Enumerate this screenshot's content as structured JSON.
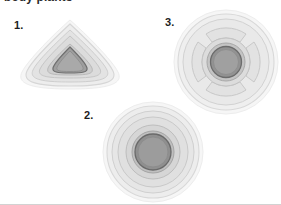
{
  "figure": {
    "heading_clipped": "body plants",
    "background_color": "#ffffff",
    "width": 281,
    "height": 205,
    "bottom_rule_color": "#d2d2d2"
  },
  "palette": {
    "halo": "#f4f4f4",
    "ring_outer": "#ededed",
    "ring_outer_stroke": "#d8d8d8",
    "ring_mid": "#e3e3e3",
    "ring_mid_stroke": "#cfcfcf",
    "ring_inner": "#d6d6d6",
    "ring_inner_stroke": "#bdbdbd",
    "core_fill": "#9a9a9a",
    "core_stroke": "#6f6f6f",
    "core_highlight": "#a8a8a8",
    "lobe_fill": "#e9e9e9",
    "lobe_stroke": "#cccccc",
    "label_color": "#1d1d1d"
  },
  "panels": [
    {
      "id": "panel-1",
      "label": "1.",
      "shape": "teardrop-conical",
      "description": "Rounded triangular teardrop outline with nested concentric contour rings and a pointed onion-dome shaped dark core at the centre",
      "core_shape": "onion-dome",
      "ring_count": 4,
      "has_radial_lobes": false,
      "position": {
        "left": 8,
        "top": 16
      },
      "size": {
        "width": 124,
        "height": 76
      }
    },
    {
      "id": "panel-2",
      "label": "2.",
      "shape": "circular",
      "description": "Circular disc with four concentric rings and a large round dark grey central core",
      "core_shape": "circle",
      "ring_count": 4,
      "has_radial_lobes": false,
      "position": {
        "left": 101,
        "top": 100
      },
      "size": {
        "width": 104,
        "height": 104
      }
    },
    {
      "id": "panel-3",
      "label": "3.",
      "shape": "circular-lobed",
      "description": "Circular disc with concentric rings divided into four lobes by diagonal radial gaps, surrounding a round dark grey central core",
      "core_shape": "circle",
      "ring_count": 4,
      "has_radial_lobes": true,
      "lobe_count": 4,
      "position": {
        "left": 172,
        "top": 8
      },
      "size": {
        "width": 116,
        "height": 108
      }
    }
  ]
}
